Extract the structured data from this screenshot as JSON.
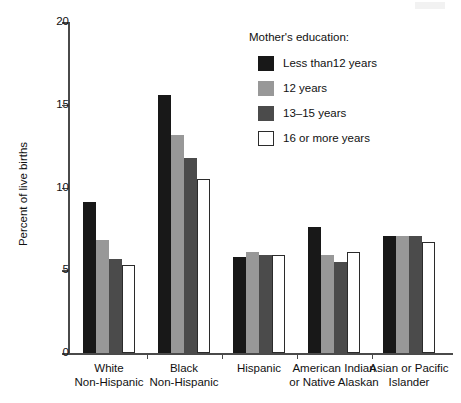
{
  "chart_data": {
    "type": "bar",
    "title": "",
    "xlabel": "",
    "ylabel": "Percent of live births",
    "ylim": [
      0,
      20
    ],
    "yticks": [
      0,
      5,
      10,
      15,
      20
    ],
    "ytick_labels": [
      "0",
      "5",
      "10",
      "15",
      "20"
    ],
    "grid": false,
    "legend_position": "upper right",
    "legend_title": "Mother's education:",
    "categories": [
      "White\nNon-Hispanic",
      "Black\nNon-Hispanic",
      "Hispanic",
      "American Indian\nor Native Alaskan",
      "Asian or Pacific\nIslander"
    ],
    "category_lines": [
      [
        "White",
        "Non-Hispanic"
      ],
      [
        "Black",
        "Non-Hispanic"
      ],
      [
        "Hispanic",
        ""
      ],
      [
        "American Indian",
        "or Native Alaskan"
      ],
      [
        "Asian or Pacific",
        "Islander"
      ]
    ],
    "series": [
      {
        "name": "Less than12 years",
        "color": "#181818",
        "values": [
          9.1,
          15.6,
          5.8,
          7.6,
          7.1
        ]
      },
      {
        "name": "12 years",
        "color": "#989898",
        "values": [
          6.8,
          13.2,
          6.1,
          5.9,
          7.1
        ]
      },
      {
        "name": "13–15 years",
        "color": "#4b4b4b",
        "values": [
          5.7,
          11.8,
          5.9,
          5.5,
          7.1
        ]
      },
      {
        "name": "16 or more years",
        "color": "#ffffff",
        "values": [
          5.3,
          10.5,
          5.9,
          6.1,
          6.7
        ]
      }
    ]
  },
  "legend": {
    "title": "Mother's education:",
    "items": [
      {
        "label": "Less than12 years",
        "swatch": "black"
      },
      {
        "label": "12 years",
        "swatch": "light-gray"
      },
      {
        "label": "13–15 years",
        "swatch": "dark-gray"
      },
      {
        "label": "16 or more years",
        "swatch": "white"
      }
    ]
  },
  "axes": {
    "y_title": "Percent of live births",
    "y_labels": [
      "20",
      "15",
      "10",
      "5",
      "0"
    ]
  },
  "x_labels": [
    {
      "line1": "White",
      "line2": "Non-Hispanic"
    },
    {
      "line1": "Black",
      "line2": "Non-Hispanic"
    },
    {
      "line1": "Hispanic",
      "line2": ""
    },
    {
      "line1": "American Indian",
      "line2": "or Native Alaskan"
    },
    {
      "line1": "Asian or Pacific",
      "line2": "Islander"
    }
  ]
}
